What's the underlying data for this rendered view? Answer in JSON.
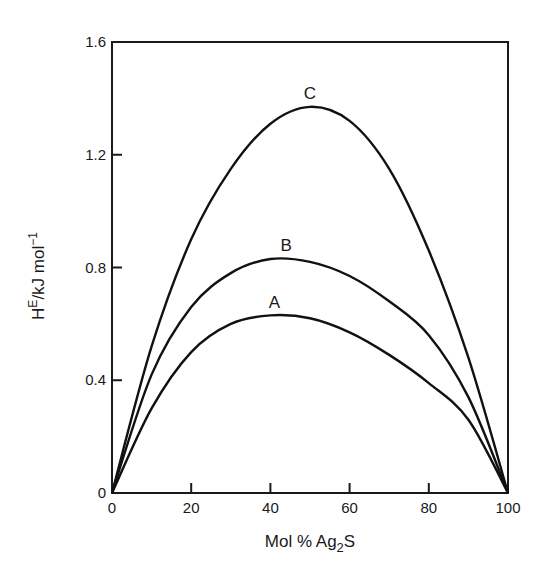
{
  "chart_data": {
    "type": "line",
    "title": "",
    "xlabel": "Mol % Ag2S",
    "xlabel_parts": {
      "main": "Mol % Ag",
      "sub": "2",
      "tail": "S"
    },
    "ylabel": "H^E / kJ mol^-1",
    "ylabel_parts": {
      "h": "H",
      "sup": "E",
      "mid": "/kJ mol",
      "exp": "−1"
    },
    "xlim": [
      0,
      100
    ],
    "ylim": [
      0,
      1.6
    ],
    "x_ticks": [
      0,
      20,
      40,
      60,
      80,
      100
    ],
    "x_tick_labels": [
      "0",
      "20",
      "40",
      "60",
      "80",
      "100"
    ],
    "y_ticks": [
      0,
      0.4,
      0.8,
      1.2,
      1.6
    ],
    "y_tick_labels": [
      "0",
      "0.4",
      "0.8",
      "1.2",
      "1.6"
    ],
    "grid": false,
    "legend": "none (curves labeled directly)",
    "x": [
      0,
      10,
      20,
      30,
      40,
      50,
      60,
      70,
      80,
      90,
      100
    ],
    "series": [
      {
        "name": "A",
        "values": [
          0,
          0.3,
          0.5,
          0.6,
          0.63,
          0.62,
          0.57,
          0.49,
          0.39,
          0.26,
          0
        ]
      },
      {
        "name": "B",
        "values": [
          0,
          0.42,
          0.66,
          0.78,
          0.83,
          0.82,
          0.77,
          0.68,
          0.56,
          0.34,
          0
        ]
      },
      {
        "name": "C",
        "values": [
          0,
          0.52,
          0.9,
          1.15,
          1.31,
          1.37,
          1.32,
          1.15,
          0.86,
          0.48,
          0
        ]
      }
    ],
    "curve_label_positions": [
      {
        "name": "A",
        "x": 41,
        "y": 0.65
      },
      {
        "name": "B",
        "x": 44,
        "y": 0.85
      },
      {
        "name": "C",
        "x": 50,
        "y": 1.39
      }
    ]
  }
}
